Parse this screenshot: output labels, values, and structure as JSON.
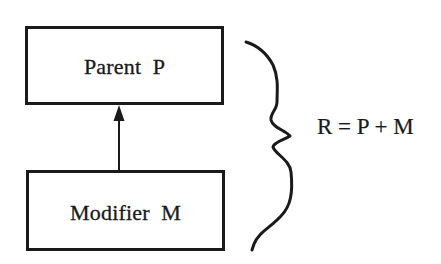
{
  "diagram": {
    "type": "inheritance",
    "colors": {
      "ink": "#1a1a1a",
      "background": "#ffffff"
    },
    "nodes": [
      {
        "id": "parent",
        "label": "Parent  P"
      },
      {
        "id": "modifier",
        "label": "Modifier  M"
      }
    ],
    "edges": [
      {
        "from": "modifier",
        "to": "parent",
        "style": "solid-arrow"
      }
    ],
    "brace": {
      "groups": [
        "parent",
        "modifier"
      ],
      "side": "right"
    },
    "equation": "R = P + M"
  }
}
